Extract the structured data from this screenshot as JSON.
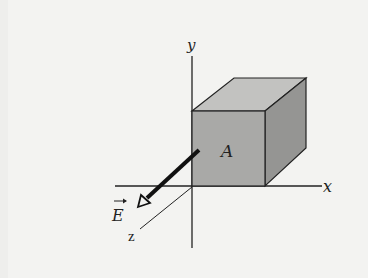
{
  "figure": {
    "labels": {
      "y_axis": "y",
      "x_axis": "x",
      "z_axis": "z",
      "face": "A",
      "field": "E"
    },
    "colors": {
      "background": "#f3f3f1",
      "cube_front": "#a9a9a7",
      "cube_top": "#c2c2c0",
      "cube_side": "#959593",
      "lines": "#222222"
    }
  }
}
